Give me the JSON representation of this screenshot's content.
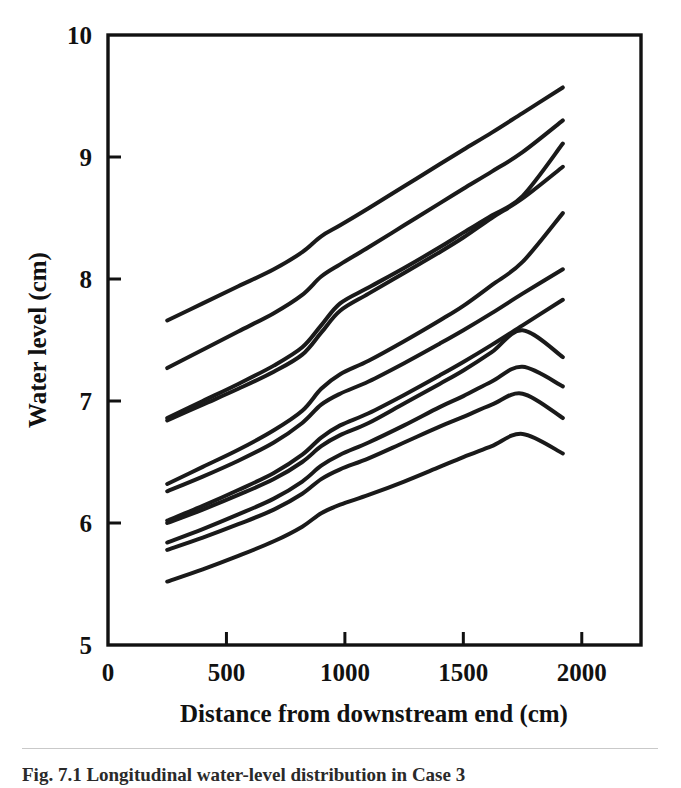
{
  "figure": {
    "caption": "Fig. 7.1  Longitudinal water-level distribution in Case 3"
  },
  "chart_data": {
    "type": "line",
    "title": "",
    "xlabel": "Distance from downstream end (cm)",
    "ylabel": "Water level (cm)",
    "xlim": [
      0,
      2250
    ],
    "ylim": [
      5,
      10
    ],
    "xticks": [
      0,
      500,
      1000,
      1500,
      2000
    ],
    "xticklabels": [
      "0",
      "500",
      "1000",
      "1500",
      "2000"
    ],
    "yticks": [
      5,
      6,
      7,
      8,
      9,
      10
    ],
    "yticklabels": [
      "5",
      "6",
      "7",
      "8",
      "9",
      "10"
    ],
    "grid": false,
    "legend": "none",
    "line_color": "#1a1a1a",
    "x": [
      250,
      400,
      550,
      700,
      820,
      900,
      980,
      1100,
      1250,
      1400,
      1500,
      1620,
      1750,
      1920
    ],
    "series": [
      {
        "name": "profile-1",
        "values": [
          7.66,
          7.8,
          7.94,
          8.08,
          8.22,
          8.35,
          8.44,
          8.58,
          8.76,
          8.94,
          9.06,
          9.2,
          9.36,
          9.57
        ]
      },
      {
        "name": "profile-2",
        "values": [
          7.27,
          7.42,
          7.57,
          7.72,
          7.87,
          8.02,
          8.12,
          8.26,
          8.44,
          8.62,
          8.74,
          8.88,
          9.04,
          9.3
        ]
      },
      {
        "name": "profile-3",
        "values": [
          6.86,
          7.0,
          7.14,
          7.29,
          7.44,
          7.62,
          7.8,
          7.93,
          8.09,
          8.26,
          8.38,
          8.52,
          8.68,
          9.11
        ]
      },
      {
        "name": "profile-4",
        "values": [
          6.84,
          6.97,
          7.1,
          7.24,
          7.38,
          7.56,
          7.74,
          7.88,
          8.05,
          8.22,
          8.34,
          8.5,
          8.66,
          8.92
        ]
      },
      {
        "name": "profile-5",
        "values": [
          6.32,
          6.46,
          6.6,
          6.76,
          6.92,
          7.1,
          7.22,
          7.33,
          7.49,
          7.66,
          7.78,
          7.95,
          8.14,
          8.54
        ]
      },
      {
        "name": "profile-6",
        "values": [
          6.26,
          6.38,
          6.51,
          6.66,
          6.82,
          6.97,
          7.06,
          7.16,
          7.31,
          7.47,
          7.58,
          7.72,
          7.88,
          8.08
        ]
      },
      {
        "name": "profile-7",
        "values": [
          6.02,
          6.14,
          6.27,
          6.41,
          6.56,
          6.7,
          6.8,
          6.9,
          7.05,
          7.21,
          7.32,
          7.46,
          7.62,
          7.83
        ]
      },
      {
        "name": "profile-8",
        "values": [
          6.0,
          6.11,
          6.23,
          6.36,
          6.5,
          6.63,
          6.72,
          6.82,
          6.98,
          7.14,
          7.25,
          7.4,
          7.58,
          7.36
        ]
      },
      {
        "name": "profile-9",
        "values": [
          5.84,
          5.95,
          6.07,
          6.2,
          6.34,
          6.47,
          6.56,
          6.66,
          6.8,
          6.95,
          7.04,
          7.16,
          7.28,
          7.12
        ]
      },
      {
        "name": "profile-10",
        "values": [
          5.78,
          5.88,
          5.99,
          6.11,
          6.24,
          6.36,
          6.44,
          6.53,
          6.66,
          6.79,
          6.87,
          6.97,
          7.06,
          6.86
        ]
      },
      {
        "name": "profile-11",
        "values": [
          5.52,
          5.62,
          5.73,
          5.85,
          5.97,
          6.08,
          6.15,
          6.23,
          6.34,
          6.46,
          6.54,
          6.63,
          6.73,
          6.57
        ]
      }
    ]
  }
}
